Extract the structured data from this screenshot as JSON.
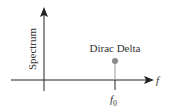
{
  "diagram": {
    "y_axis_label": "Spectrum",
    "x_axis_label": "f",
    "delta_label": "Dirac Delta",
    "tick_label_base": "f",
    "tick_label_sub": "0",
    "colors": {
      "axis": "#222222",
      "stem": "#9a9a9a",
      "dot": "#8a8a8a",
      "text": "#333333"
    }
  }
}
